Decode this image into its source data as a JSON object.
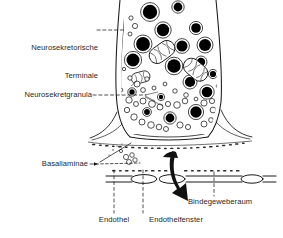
{
  "figure": {
    "kind": "schematic-diagram",
    "language": "de",
    "background_color": "#ffffff",
    "ink_color": "#1a1a1a",
    "granule_fill": "#000000",
    "vesicle_fill": "#ffffff"
  },
  "labels": {
    "terminal_line1": "Neurosekretorische",
    "terminal_line2": "Terminale",
    "granula": "Neurosekretgranula",
    "basallaminae": "Basallaminae",
    "endothel": "Endothel",
    "endothelfenster": "Endothelfenster",
    "bindegeweberaum": "Bindegeweberaum"
  },
  "structures": {
    "terminal": "Neurosekretorische Terminale",
    "granules": "Neurosekretgranula",
    "mitochondria": "Mitochondrien",
    "clear_vesicles": "klare Vesikel",
    "basal_lamina_upper": "Basallamina (Terminale)",
    "basal_lamina_lower": "Basallamina (Endothel)",
    "endothelium": "Endothel",
    "fenestration": "Endothelfenster",
    "connective_tissue_space": "Bindegeweberaum",
    "secretion_arrow": "Sekretionsrichtung"
  }
}
